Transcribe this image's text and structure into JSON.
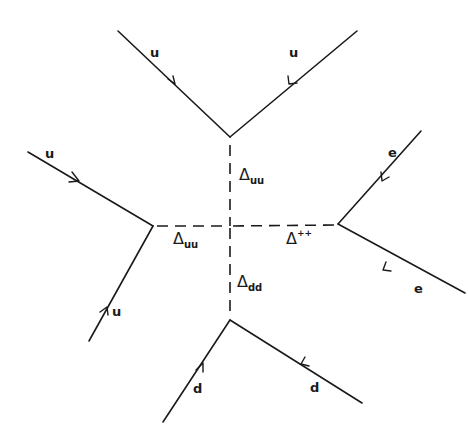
{
  "diagram": {
    "type": "feynman-diagram",
    "colors": {
      "line": "#1a1a1a",
      "background": "#ffffff"
    },
    "external_lines": [
      {
        "id": "top-left-u",
        "label": "u"
      },
      {
        "id": "top-right-u",
        "label": "u"
      },
      {
        "id": "left-upper-u",
        "label": "u"
      },
      {
        "id": "left-lower-u",
        "label": "u"
      },
      {
        "id": "right-upper-e",
        "label": "e"
      },
      {
        "id": "right-lower-e",
        "label": "e"
      },
      {
        "id": "bottom-left-d",
        "label": "d"
      },
      {
        "id": "bottom-right-d",
        "label": "d"
      }
    ],
    "propagators": [
      {
        "id": "delta-uu-vertical",
        "symbol": "Δ",
        "subscript": "uu",
        "superscript": ""
      },
      {
        "id": "delta-uu-horizontal",
        "symbol": "Δ",
        "subscript": "uu",
        "superscript": ""
      },
      {
        "id": "delta-plusplus",
        "symbol": "Δ",
        "subscript": "",
        "superscript": "++"
      },
      {
        "id": "delta-dd",
        "symbol": "Δ",
        "subscript": "dd",
        "superscript": ""
      }
    ]
  }
}
